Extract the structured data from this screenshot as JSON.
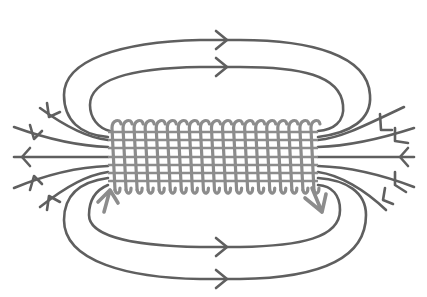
{
  "diagram": {
    "subject": "Magnetic field lines around a current-carrying solenoid",
    "colors": {
      "background": "#ffffff",
      "field_lines": "#5f5f5f",
      "coil": "#8c8c8c",
      "current_arrows": "#8c8c8c"
    },
    "solenoid": {
      "turns": 19,
      "x_start": 108,
      "x_end": 318,
      "y_top": 120,
      "y_bottom": 190,
      "axis_y": 157
    },
    "field_lines": {
      "top_loops": [
        {
          "name": "outer-top-loop",
          "arrow_direction": "right"
        },
        {
          "name": "inner-top-loop",
          "arrow_direction": "right"
        }
      ],
      "bottom_loops": [
        {
          "name": "inner-bottom-loop",
          "arrow_direction": "right"
        },
        {
          "name": "outer-bottom-loop",
          "arrow_direction": "right"
        }
      ],
      "left_end_lines": 5,
      "left_end_arrow_direction": "outward-left",
      "right_end_lines": 5,
      "right_end_arrow_direction": "inward-left"
    },
    "current_arrows": [
      {
        "position": "left-below-coil",
        "direction": "up"
      },
      {
        "position": "right-below-coil",
        "direction": "down"
      }
    ]
  }
}
